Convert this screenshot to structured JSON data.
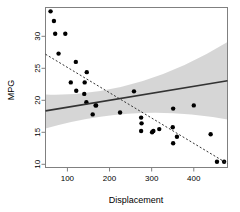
{
  "chart_data": {
    "type": "scatter",
    "title": "",
    "xlabel": "Displacement",
    "ylabel": "MPG",
    "xlim": [
      48,
      480
    ],
    "ylim": [
      9.5,
      34.5
    ],
    "xticks": [
      100,
      200,
      300,
      400
    ],
    "yticks": [
      10,
      15,
      20,
      25,
      30
    ],
    "grid": false,
    "legend": "none",
    "points": [
      {
        "x": 60,
        "y": 33.9
      },
      {
        "x": 68,
        "y": 32.4
      },
      {
        "x": 71,
        "y": 30.4
      },
      {
        "x": 95,
        "y": 30.4
      },
      {
        "x": 79,
        "y": 27.3
      },
      {
        "x": 120,
        "y": 26.0
      },
      {
        "x": 146,
        "y": 24.4
      },
      {
        "x": 108,
        "y": 22.8
      },
      {
        "x": 141,
        "y": 22.8
      },
      {
        "x": 121,
        "y": 21.5
      },
      {
        "x": 258,
        "y": 21.4
      },
      {
        "x": 140,
        "y": 21.0
      },
      {
        "x": 145,
        "y": 19.7
      },
      {
        "x": 167,
        "y": 19.2
      },
      {
        "x": 168,
        "y": 19.2
      },
      {
        "x": 400,
        "y": 19.2
      },
      {
        "x": 351,
        "y": 18.7
      },
      {
        "x": 225,
        "y": 18.1
      },
      {
        "x": 160,
        "y": 17.8
      },
      {
        "x": 275,
        "y": 17.3
      },
      {
        "x": 276,
        "y": 16.4
      },
      {
        "x": 318,
        "y": 15.5
      },
      {
        "x": 304,
        "y": 15.2
      },
      {
        "x": 275,
        "y": 15.2
      },
      {
        "x": 301,
        "y": 15.0
      },
      {
        "x": 350,
        "y": 15.8
      },
      {
        "x": 440,
        "y": 14.7
      },
      {
        "x": 360,
        "y": 14.3
      },
      {
        "x": 351,
        "y": 13.3
      },
      {
        "x": 455,
        "y": 10.4
      },
      {
        "x": 472,
        "y": 10.4
      }
    ],
    "regression_line": {
      "style": "solid",
      "color": "#333333",
      "x_start": 48,
      "y_start": 18.35,
      "x_end": 480,
      "y_end": 23.05
    },
    "reference_line": {
      "style": "dashed",
      "color": "#333333",
      "x_start": 48,
      "y_start": 27.2,
      "x_end": 480,
      "y_end": 10.1
    },
    "confidence_band": {
      "color": "#c8c8c8",
      "opacity": 0.75,
      "x_start": 48,
      "x_end": 480,
      "upper_start": 20.9,
      "lower_start": 15.6,
      "upper_mid": 20.4,
      "lower_mid": 19.7,
      "upper_end": 29.1,
      "lower_end": 17.0
    },
    "point_style": {
      "shape": "circle",
      "color": "#000000",
      "radius": 2.2
    },
    "box_border_color": "#808080"
  }
}
